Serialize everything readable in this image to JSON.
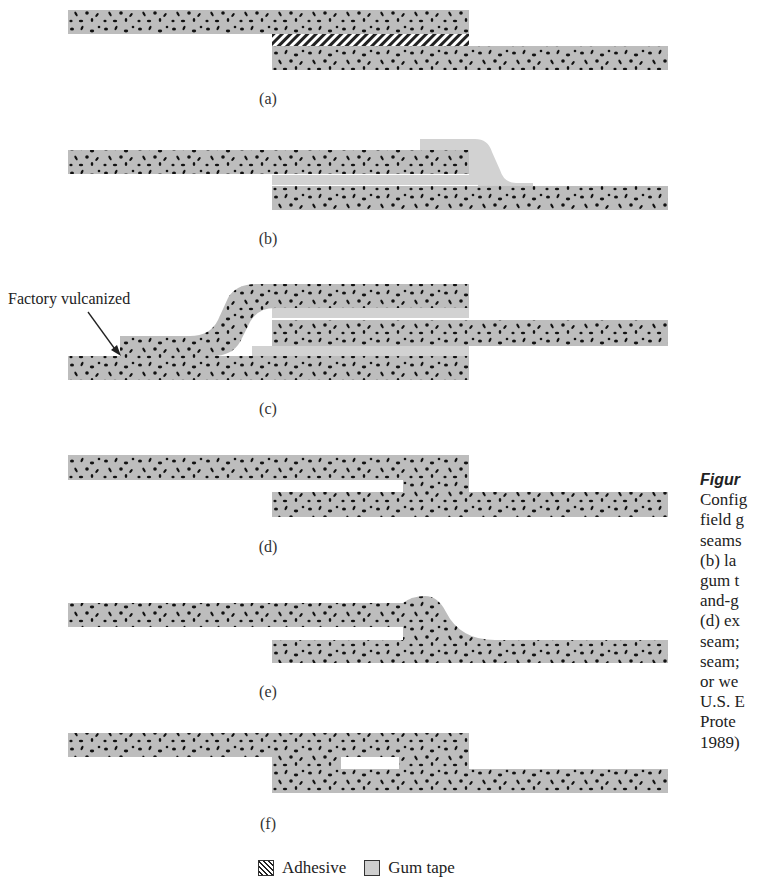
{
  "figure": {
    "subfigure_labels": [
      "(a)",
      "(b)",
      "(c)",
      "(d)",
      "(e)",
      "(f)"
    ],
    "callout_label": "Factory vulcanized",
    "legend": [
      {
        "swatch": "hatched",
        "label": "Adhesive"
      },
      {
        "swatch": "light-gray",
        "label": "Gum tape"
      }
    ],
    "colors": {
      "membrane": "#bdbdbd",
      "gum_tape": "#d2d2d2",
      "speckle": "#111111"
    }
  },
  "caption": {
    "title": "Figur",
    "lines": [
      "Config",
      "field g",
      "seams",
      "(b) la",
      "gum t",
      "and-g",
      "(d) ex",
      "seam;",
      "seam;",
      "or we",
      "U.S. E",
      "Prote",
      "1989)"
    ]
  }
}
